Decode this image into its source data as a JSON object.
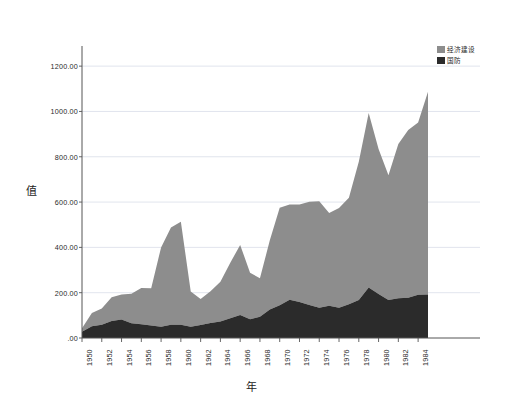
{
  "chart_data": {
    "type": "area",
    "stacked": true,
    "title": "",
    "xlabel": "年",
    "ylabel": "值",
    "ylim": [
      0,
      1280
    ],
    "xlim": [
      1950,
      1985
    ],
    "grid": true,
    "legend_position": "top-right",
    "ytick_labels": [
      ".00",
      "200.00",
      "400.00",
      "600.00",
      "800.00",
      "1000.00",
      "1200.00"
    ],
    "ytick_values": [
      0,
      200,
      400,
      600,
      800,
      1000,
      1200
    ],
    "xtick_labels": [
      "1950",
      "1952",
      "1954",
      "1956",
      "1958",
      "1960",
      "1962",
      "1964",
      "1966",
      "1968",
      "1970",
      "1972",
      "1974",
      "1976",
      "1978",
      "1980",
      "1982",
      "1984"
    ],
    "xtick_values": [
      1950,
      1952,
      1954,
      1956,
      1958,
      1960,
      1962,
      1964,
      1966,
      1968,
      1970,
      1972,
      1974,
      1976,
      1978,
      1980,
      1982,
      1984
    ],
    "x": [
      1950,
      1951,
      1952,
      1953,
      1954,
      1955,
      1956,
      1957,
      1958,
      1959,
      1960,
      1961,
      1962,
      1963,
      1964,
      1965,
      1966,
      1967,
      1968,
      1969,
      1970,
      1971,
      1972,
      1973,
      1974,
      1975,
      1976,
      1977,
      1978,
      1979,
      1980,
      1981,
      1982,
      1983,
      1984,
      1985
    ],
    "colors": {
      "economic": "#8d8d8d",
      "defense": "#2b2b2b",
      "grid": "#d9dde8",
      "axis": "#555555",
      "background": "#ffffff"
    },
    "series": [
      {
        "name": "国防",
        "color": "#2b2b2b",
        "values": [
          28,
          52,
          58,
          75,
          82,
          65,
          61,
          55,
          50,
          58,
          58,
          50,
          57,
          66,
          73,
          87,
          101,
          83,
          94,
          126,
          145,
          169,
          159,
          146,
          134,
          142,
          134,
          149,
          168,
          223,
          194,
          168,
          176,
          178,
          191,
          192
        ]
      },
      {
        "name": "经济建设",
        "color": "#8d8d8d",
        "values": [
          15,
          58,
          72,
          105,
          110,
          130,
          160,
          165,
          350,
          430,
          455,
          155,
          115,
          140,
          175,
          245,
          310,
          205,
          170,
          305,
          430,
          420,
          430,
          455,
          470,
          410,
          440,
          470,
          610,
          770,
          640,
          550,
          680,
          740,
          760,
          895
        ]
      }
    ],
    "totals": [
      43,
      110,
      130,
      180,
      192,
      195,
      221,
      220,
      400,
      488,
      513,
      205,
      172,
      206,
      248,
      332,
      411,
      288,
      264,
      431,
      575,
      589,
      589,
      601,
      604,
      552,
      574,
      619,
      778,
      993,
      834,
      718,
      856,
      918,
      951,
      1087
    ]
  },
  "legend": {
    "items": [
      {
        "label": "经济建设",
        "color": "#8d8d8d",
        "swatch": "economic-swatch"
      },
      {
        "label": "国防",
        "color": "#2b2b2b",
        "swatch": "defense-swatch"
      }
    ]
  },
  "axes": {
    "y_title": "值",
    "x_title": "年"
  }
}
